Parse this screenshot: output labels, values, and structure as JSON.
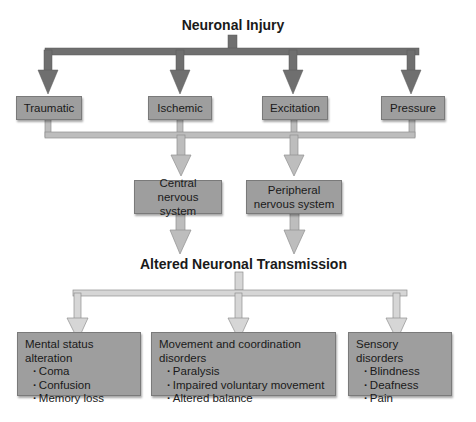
{
  "diagram": {
    "top_title": "Neuronal Injury",
    "causes": [
      {
        "label": "Traumatic"
      },
      {
        "label": "Ischemic"
      },
      {
        "label": "Excitation"
      },
      {
        "label": "Pressure"
      }
    ],
    "systems": [
      {
        "label": "Central nervous system"
      },
      {
        "label": "Peripheral nervous system"
      }
    ],
    "middle_title": "Altered Neuronal Transmission",
    "outcomes": [
      {
        "heading": "Mental status alteration",
        "items": [
          "Coma",
          "Confusion",
          "Memory loss"
        ]
      },
      {
        "heading": "Movement and coordination disorders",
        "items": [
          "Paralysis",
          "Impaired voluntary movement",
          "Altered balance"
        ]
      },
      {
        "heading": "Sensory disorders",
        "items": [
          "Blindness",
          "Deafness",
          "Pain"
        ]
      }
    ],
    "colors": {
      "box_fill": "#9e9e9e",
      "dark_arrow": "#6f6f6f",
      "light_arrow": "#bdbdbd"
    }
  }
}
